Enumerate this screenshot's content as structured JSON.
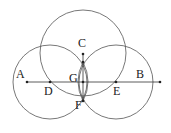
{
  "diagram": {
    "type": "geometric-construction",
    "line_AB": {
      "from": "A",
      "to": "B"
    },
    "points": {
      "A": {
        "label": "A",
        "x": 27,
        "y": 82
      },
      "B": {
        "label": "B",
        "x": 160,
        "y": 82
      },
      "C": {
        "label": "C",
        "x": 83,
        "y": 54
      },
      "D": {
        "label": "D",
        "x": 50,
        "y": 82
      },
      "E": {
        "label": "E",
        "x": 116,
        "y": 82
      },
      "F": {
        "label": "F",
        "x": 83,
        "y": 101
      },
      "G": {
        "label": "G",
        "x": 83,
        "y": 82
      }
    },
    "circles": [
      {
        "name": "circle-D",
        "center": "D",
        "r": 37
      },
      {
        "name": "circle-E",
        "center": "E",
        "r": 37
      },
      {
        "name": "circle-top",
        "cx": 83,
        "cy": 53,
        "r": 43
      }
    ],
    "labels": {
      "A": "A",
      "B": "B",
      "C": "C",
      "D": "D",
      "E": "E",
      "F": "F",
      "G": "G"
    },
    "colors": {
      "stroke": "#555555",
      "text": "#222222",
      "background": "#ffffff"
    }
  }
}
